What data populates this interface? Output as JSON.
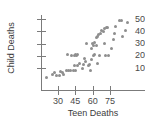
{
  "chart_data": {
    "type": "scatter",
    "title": "",
    "xlabel": "Teen Deaths",
    "ylabel": "Child Deaths",
    "xticks": [
      30,
      45,
      60,
      75
    ],
    "yticks": [
      10,
      20,
      30,
      40,
      50
    ],
    "xlim": [
      18,
      108
    ],
    "ylim": [
      0,
      56
    ],
    "grid": false,
    "legend": null,
    "marker": "filled-circle",
    "marker_color": "#8e8e8e",
    "points": [
      {
        "x": 20,
        "y": 2
      },
      {
        "x": 25,
        "y": 5
      },
      {
        "x": 27,
        "y": 6
      },
      {
        "x": 29,
        "y": 4
      },
      {
        "x": 31,
        "y": 4
      },
      {
        "x": 32,
        "y": 7
      },
      {
        "x": 34,
        "y": 6
      },
      {
        "x": 35,
        "y": 5
      },
      {
        "x": 37,
        "y": 8
      },
      {
        "x": 39,
        "y": 8
      },
      {
        "x": 41,
        "y": 8
      },
      {
        "x": 43,
        "y": 8
      },
      {
        "x": 45,
        "y": 8
      },
      {
        "x": 38,
        "y": 21
      },
      {
        "x": 42,
        "y": 20
      },
      {
        "x": 44,
        "y": 20
      },
      {
        "x": 45,
        "y": 21
      },
      {
        "x": 46,
        "y": 20
      },
      {
        "x": 47,
        "y": 21
      },
      {
        "x": 44,
        "y": 12
      },
      {
        "x": 47,
        "y": 12
      },
      {
        "x": 49,
        "y": 14
      },
      {
        "x": 51,
        "y": 10
      },
      {
        "x": 52,
        "y": 13
      },
      {
        "x": 53,
        "y": 18
      },
      {
        "x": 54,
        "y": 15
      },
      {
        "x": 55,
        "y": 30
      },
      {
        "x": 56,
        "y": 12
      },
      {
        "x": 57,
        "y": 13
      },
      {
        "x": 58,
        "y": 8
      },
      {
        "x": 59,
        "y": 17
      },
      {
        "x": 59,
        "y": 26
      },
      {
        "x": 60,
        "y": 30
      },
      {
        "x": 61,
        "y": 28
      },
      {
        "x": 61,
        "y": 20
      },
      {
        "x": 62,
        "y": 31
      },
      {
        "x": 62,
        "y": 21
      },
      {
        "x": 63,
        "y": 35
      },
      {
        "x": 63,
        "y": 28
      },
      {
        "x": 64,
        "y": 36
      },
      {
        "x": 64,
        "y": 14
      },
      {
        "x": 65,
        "y": 37
      },
      {
        "x": 66,
        "y": 20
      },
      {
        "x": 67,
        "y": 38
      },
      {
        "x": 68,
        "y": 41
      },
      {
        "x": 69,
        "y": 40
      },
      {
        "x": 70,
        "y": 42
      },
      {
        "x": 70,
        "y": 30
      },
      {
        "x": 71,
        "y": 20
      },
      {
        "x": 72,
        "y": 43
      },
      {
        "x": 73,
        "y": 43
      },
      {
        "x": 74,
        "y": 20
      },
      {
        "x": 76,
        "y": 26
      },
      {
        "x": 78,
        "y": 33
      },
      {
        "x": 79,
        "y": 38
      },
      {
        "x": 80,
        "y": 44
      },
      {
        "x": 83,
        "y": 49
      },
      {
        "x": 85,
        "y": 49
      },
      {
        "x": 86,
        "y": 36
      },
      {
        "x": 88,
        "y": 41
      },
      {
        "x": 90,
        "y": 47
      }
    ]
  },
  "axes": {
    "y_title": "Child Deaths",
    "x_title": "Teen Deaths",
    "y_tick_labels": [
      "50",
      "40",
      "30",
      "20",
      "10"
    ],
    "x_tick_labels": [
      "30",
      "45",
      "60",
      "75"
    ]
  }
}
